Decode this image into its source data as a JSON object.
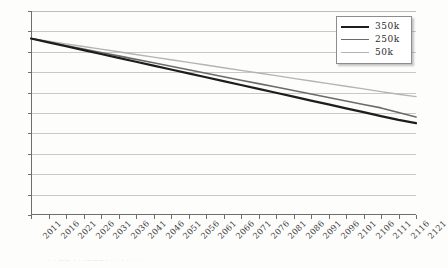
{
  "chart_data": {
    "type": "line",
    "title": "",
    "xlabel": "",
    "ylabel": "",
    "ylim": [
      0,
      100
    ],
    "ytick_values": [
      0,
      10,
      20,
      30,
      40,
      50,
      60,
      70,
      80,
      90,
      100
    ],
    "ytick_labels": [
      "0",
      "10",
      "20",
      "30",
      "40",
      "50",
      "60",
      "70",
      "80",
      "90",
      "100"
    ],
    "grid": true,
    "legend_position": "top-right",
    "x": [
      2011,
      2016,
      2021,
      2026,
      2031,
      2036,
      2041,
      2046,
      2051,
      2056,
      2061,
      2066,
      2071,
      2076,
      2081,
      2086,
      2091,
      2096,
      2101,
      2106,
      2111,
      2116,
      2121
    ],
    "xtick_labels": [
      "2011",
      "2016",
      "2021",
      "2026",
      "2031",
      "2036",
      "2041",
      "2046",
      "2051",
      "2056",
      "2061",
      "2066",
      "2071",
      "2076",
      "2081",
      "2086",
      "2091",
      "2096",
      "2101",
      "2106",
      "2111",
      "2116",
      "2121"
    ],
    "series": [
      {
        "name": "350k",
        "color": "#1d1d1d",
        "width": 2.2,
        "values": [
          86.5,
          84.6,
          82.7,
          80.8,
          78.9,
          77.0,
          75.1,
          73.2,
          71.3,
          69.4,
          67.5,
          65.6,
          63.7,
          61.8,
          59.9,
          58.0,
          56.1,
          54.2,
          52.3,
          50.4,
          48.5,
          46.6,
          45.0
        ]
      },
      {
        "name": "250k",
        "color": "#6b6b6b",
        "width": 1.6,
        "values": [
          86.5,
          84.8,
          83.1,
          81.4,
          79.7,
          78.0,
          76.3,
          74.6,
          72.9,
          71.2,
          69.5,
          67.8,
          66.1,
          64.4,
          62.7,
          61.0,
          59.3,
          57.6,
          55.9,
          54.2,
          52.5,
          50.2,
          48.0
        ]
      },
      {
        "name": "50k",
        "color": "#b4b4b4",
        "width": 1.4,
        "values": [
          86.5,
          85.2,
          83.9,
          82.6,
          81.3,
          80.0,
          78.7,
          77.4,
          76.1,
          74.8,
          73.5,
          72.2,
          70.9,
          69.6,
          68.3,
          67.0,
          65.7,
          64.4,
          63.1,
          61.8,
          60.5,
          59.2,
          58.0
        ]
      }
    ]
  },
  "legend": {
    "entries": [
      {
        "label": "350k"
      },
      {
        "label": "250k"
      },
      {
        "label": "50k"
      }
    ]
  },
  "caption": {
    "text": "·  ·   ——   ·    ·      ·———·     ·        ·        ·           ·        ·     ·"
  }
}
